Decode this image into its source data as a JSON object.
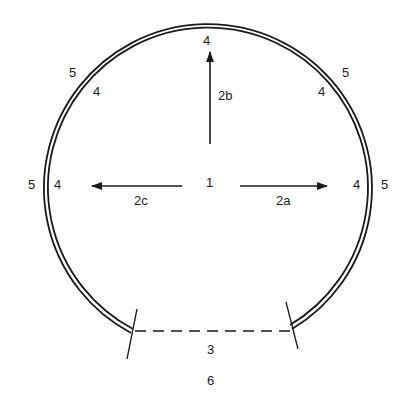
{
  "diagram": {
    "type": "tunnel-cross-section",
    "colors": {
      "line": "#1a1a1a",
      "background": "#ffffff"
    },
    "labels": {
      "center": "1",
      "arrow_right": "2a",
      "arrow_up": "2b",
      "arrow_left": "2c",
      "invert_line": "3",
      "inner_top": "4",
      "inner_upper_left": "4",
      "inner_upper_right": "4",
      "inner_left": "4",
      "inner_right": "4",
      "outer_upper_left": "5",
      "outer_upper_right": "5",
      "outer_left": "5",
      "outer_right": "5",
      "caption": "6"
    },
    "elements": [
      {
        "name": "lining",
        "shape": "double-line open circular arc"
      },
      {
        "name": "invert",
        "shape": "dashed horizontal line"
      },
      {
        "name": "arrows",
        "count": 3,
        "directions": [
          "right",
          "up",
          "left"
        ]
      },
      {
        "name": "end-ticks",
        "count": 2
      }
    ]
  }
}
